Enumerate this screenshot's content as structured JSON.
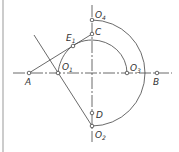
{
  "figure": {
    "type": "geometric-construction",
    "points": [
      {
        "id": "A",
        "label": "A",
        "sub": "",
        "x": 29,
        "y": 73,
        "lx": 25,
        "ly": 85
      },
      {
        "id": "O1",
        "label": "O",
        "sub": "1",
        "x": 58,
        "y": 73,
        "lx": 62,
        "ly": 70
      },
      {
        "id": "O3",
        "label": "O",
        "sub": "3",
        "x": 127,
        "y": 73,
        "lx": 130,
        "ly": 71
      },
      {
        "id": "B",
        "label": "B",
        "sub": "",
        "x": 157,
        "y": 73,
        "lx": 153,
        "ly": 85
      },
      {
        "id": "O4",
        "label": "O",
        "sub": "4",
        "x": 92,
        "y": 20,
        "lx": 95,
        "ly": 18
      },
      {
        "id": "C",
        "label": "C",
        "sub": "",
        "x": 92,
        "y": 34,
        "lx": 95,
        "ly": 35
      },
      {
        "id": "E1",
        "label": "E",
        "sub": "1",
        "x": 73,
        "y": 46,
        "lx": 66,
        "ly": 41
      },
      {
        "id": "D",
        "label": "D",
        "sub": "",
        "x": 92,
        "y": 113,
        "lx": 96,
        "ly": 118
      },
      {
        "id": "O2",
        "label": "O",
        "sub": "2",
        "x": 92,
        "y": 126,
        "lx": 95,
        "ly": 138
      }
    ],
    "colors": {
      "line": "#444444",
      "border": "#bbbbbb"
    }
  }
}
